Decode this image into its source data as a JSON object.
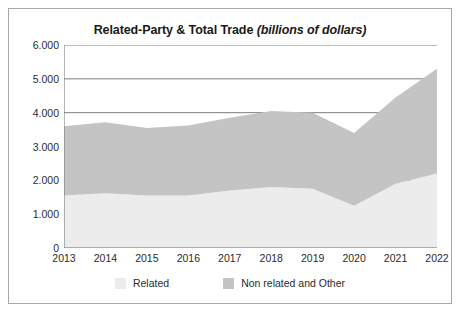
{
  "chart_data": {
    "type": "area",
    "stacked": true,
    "title": "Related-Party & Total Trade (billions of dollars)",
    "title_main": "Related-Party & Total Trade ",
    "title_unit": "(billions of dollars)",
    "xlabel": "",
    "ylabel": "",
    "categories": [
      "2013",
      "2014",
      "2015",
      "2016",
      "2017",
      "2018",
      "2019",
      "2020",
      "2021",
      "2022"
    ],
    "x": [
      2013,
      2014,
      2015,
      2016,
      2017,
      2018,
      2019,
      2020,
      2021,
      2022
    ],
    "ylim": [
      0,
      6.0
    ],
    "yticks": [
      0,
      1.0,
      2.0,
      3.0,
      4.0,
      5.0,
      6.0
    ],
    "ytick_labels": [
      "0",
      "1.000",
      "2.000",
      "3.000",
      "4.000",
      "5.000",
      "6.000"
    ],
    "grid": true,
    "grid_axis": "y",
    "legend_position": "bottom",
    "series": [
      {
        "name": "Related",
        "color": "#ececec",
        "values": [
          1.55,
          1.62,
          1.55,
          1.55,
          1.7,
          1.8,
          1.75,
          1.25,
          1.9,
          2.2
        ]
      },
      {
        "name": "Non related and Other",
        "color": "#c4c4c4",
        "values": [
          2.05,
          2.1,
          2.0,
          2.07,
          2.15,
          2.25,
          2.25,
          2.15,
          2.55,
          3.1
        ]
      }
    ],
    "totals": [
      3.6,
      3.72,
      3.55,
      3.62,
      3.85,
      4.05,
      4.0,
      3.4,
      4.45,
      5.3
    ]
  },
  "legend": {
    "items": [
      {
        "label": "Related",
        "color": "#ececec"
      },
      {
        "label": "Non related and Other",
        "color": "#c4c4c4"
      }
    ]
  },
  "colors": {
    "related": "#ececec",
    "non_related": "#c4c4c4",
    "gridline": "#6f6f6f",
    "axis": "#6f6f6f",
    "border": "#a8a8a8",
    "text": "#2b2b2b"
  }
}
